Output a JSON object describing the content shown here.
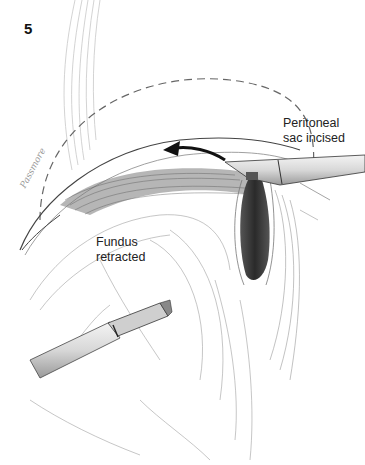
{
  "figure": {
    "number": "5",
    "labels": {
      "peritoneal_line1": "Peritoneal",
      "peritoneal_line2": "sac incised",
      "fundus_line1": "Fundus",
      "fundus_line2": "retracted"
    },
    "signature": "Passmore",
    "colors": {
      "background": "#ffffff",
      "ink": "#222222",
      "shading_dark": "#3a3a3a",
      "shading_light": "#b5b5b5"
    },
    "icons": {
      "direction_arrow": "arrow-left-curved-icon",
      "upper_instrument": "laparoscopic-instrument-icon",
      "lower_instrument": "laparoscopic-grasper-icon"
    }
  }
}
